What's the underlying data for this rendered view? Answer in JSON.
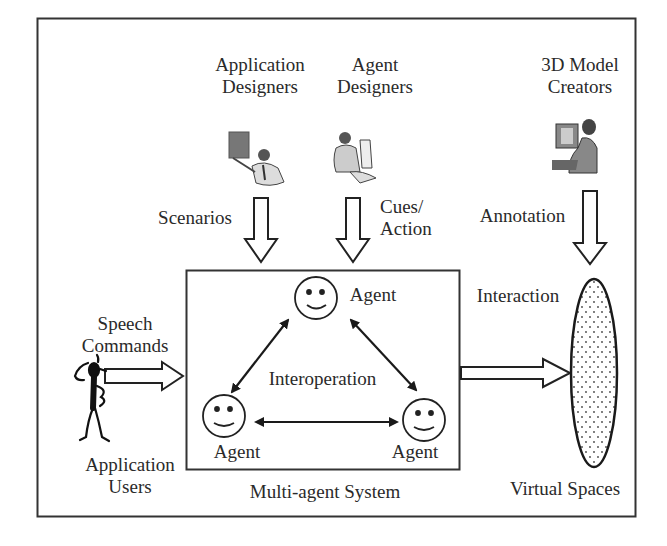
{
  "diagram": {
    "stakeholders": {
      "application_designers": {
        "line1": "Application",
        "line2": "Designers"
      },
      "agent_designers": {
        "line1": "Agent",
        "line2": "Designers"
      },
      "model_creators": {
        "line1": "3D Model",
        "line2": "Creators"
      }
    },
    "flows": {
      "scenarios": "Scenarios",
      "cues_action": {
        "line1": "Cues/",
        "line2": "Action"
      },
      "annotation": "Annotation",
      "interaction": "Interaction",
      "speech_commands": {
        "line1": "Speech",
        "line2": "Commands"
      }
    },
    "system": {
      "caption": "Multi-agent System",
      "interoperation": "Interoperation",
      "agents": [
        "Agent",
        "Agent",
        "Agent"
      ]
    },
    "users": {
      "line1": "Application",
      "line2": "Users"
    },
    "virtual_spaces": "Virtual Spaces",
    "icons": [
      "presenter-clipart-icon",
      "designer-at-computer-clipart-icon",
      "creator-at-computer-clipart-icon",
      "stick-figure-user-icon",
      "smiley-agent-icon"
    ],
    "colors": {
      "stroke": "#1a1a1a",
      "background": "#ffffff"
    }
  }
}
